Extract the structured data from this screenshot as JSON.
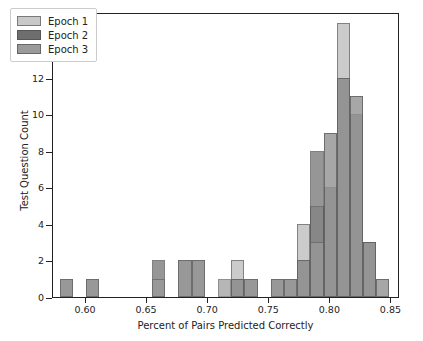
{
  "chart_data": {
    "type": "bar",
    "subtype": "histogram-overlay",
    "title": "",
    "xlabel": "Percent of Pairs Predicted Correctly",
    "ylabel": "Test Question Count",
    "xlim": [
      0.573,
      0.857
    ],
    "ylim": [
      0,
      15.6
    ],
    "xticks": [
      0.6,
      0.65,
      0.7,
      0.75,
      0.8,
      0.85
    ],
    "xticklabels": [
      "0.60",
      "0.65",
      "0.70",
      "0.75",
      "0.80",
      "0.85"
    ],
    "yticks": [
      0,
      2,
      4,
      6,
      8,
      10,
      12,
      14
    ],
    "yticklabels": [
      "0",
      "2",
      "4",
      "6",
      "8",
      "10",
      "12",
      "14"
    ],
    "grid": false,
    "legend_position": "upper left",
    "bin_width": 0.0108,
    "series": [
      {
        "name": "Epoch 1",
        "color": "#c9c9c9",
        "bins": [
          {
            "x": 0.7243,
            "count": 2
          },
          {
            "x": 0.7782,
            "count": 4
          },
          {
            "x": 0.789,
            "count": 5
          },
          {
            "x": 0.7998,
            "count": 9
          },
          {
            "x": 0.8106,
            "count": 15
          },
          {
            "x": 0.8214,
            "count": 11
          },
          {
            "x": 0.8322,
            "count": 3
          },
          {
            "x": 0.843,
            "count": 1
          }
        ]
      },
      {
        "name": "Epoch 2",
        "color": "#6e6e6e",
        "bins": [
          {
            "x": 0.584,
            "count": 1
          },
          {
            "x": 0.6055,
            "count": 1
          },
          {
            "x": 0.6594,
            "count": 2
          },
          {
            "x": 0.681,
            "count": 2
          },
          {
            "x": 0.6918,
            "count": 2
          },
          {
            "x": 0.7243,
            "count": 1
          },
          {
            "x": 0.7351,
            "count": 1
          },
          {
            "x": 0.7566,
            "count": 1
          },
          {
            "x": 0.7674,
            "count": 1
          },
          {
            "x": 0.7782,
            "count": 2
          },
          {
            "x": 0.789,
            "count": 8
          },
          {
            "x": 0.7998,
            "count": 6
          },
          {
            "x": 0.8106,
            "count": 12
          },
          {
            "x": 0.8214,
            "count": 10
          },
          {
            "x": 0.8322,
            "count": 3
          }
        ]
      },
      {
        "name": "Epoch 3",
        "color": "#9a9a9a",
        "bins": [
          {
            "x": 0.584,
            "count": 1
          },
          {
            "x": 0.6055,
            "count": 1
          },
          {
            "x": 0.6594,
            "count": 1
          },
          {
            "x": 0.681,
            "count": 2
          },
          {
            "x": 0.6918,
            "count": 2
          },
          {
            "x": 0.7135,
            "count": 1
          },
          {
            "x": 0.7243,
            "count": 1
          },
          {
            "x": 0.7351,
            "count": 1
          },
          {
            "x": 0.7566,
            "count": 1
          },
          {
            "x": 0.7674,
            "count": 1
          },
          {
            "x": 0.7782,
            "count": 2
          },
          {
            "x": 0.789,
            "count": 3
          },
          {
            "x": 0.7998,
            "count": 9
          },
          {
            "x": 0.8106,
            "count": 12
          },
          {
            "x": 0.8214,
            "count": 11
          },
          {
            "x": 0.8322,
            "count": 3
          },
          {
            "x": 0.843,
            "count": 1
          }
        ]
      }
    ]
  },
  "legend": {
    "items": [
      {
        "label": "Epoch 1",
        "color": "#c9c9c9"
      },
      {
        "label": "Epoch 2",
        "color": "#6e6e6e"
      },
      {
        "label": "Epoch 3",
        "color": "#9a9a9a"
      }
    ]
  },
  "axis": {
    "xlabel": "Percent of Pairs Predicted Correctly",
    "ylabel": "Test Question Count"
  }
}
